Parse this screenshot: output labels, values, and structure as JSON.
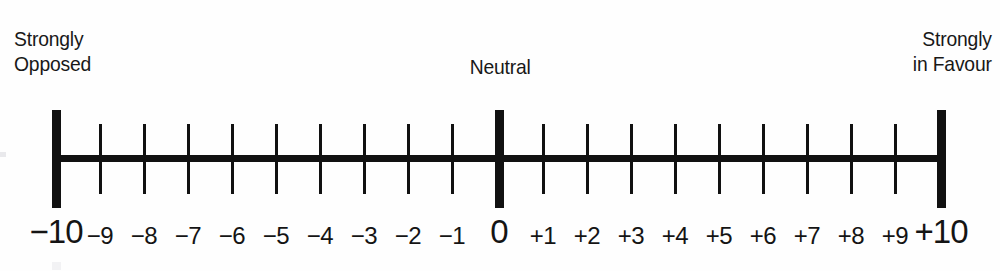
{
  "figure": {
    "name": "bipolar-opinion-rating-scale",
    "range_min": -10,
    "range_max": 10,
    "line_color": "#111111",
    "text_color": "#181818",
    "background": "#ffffff"
  },
  "anchors": {
    "left": "Strongly\nOpposed",
    "center": "Neutral",
    "right": "Strongly\nin Favour"
  },
  "scale": {
    "numbers": [
      {
        "value": -10,
        "label": "−10",
        "emphasis": "major",
        "x": 56
      },
      {
        "value": -9,
        "label": "−9",
        "emphasis": "minor",
        "x": 100
      },
      {
        "value": -8,
        "label": "−8",
        "emphasis": "minor",
        "x": 144
      },
      {
        "value": -7,
        "label": "−7",
        "emphasis": "minor",
        "x": 188
      },
      {
        "value": -6,
        "label": "−6",
        "emphasis": "minor",
        "x": 232
      },
      {
        "value": -5,
        "label": "−5",
        "emphasis": "minor",
        "x": 276
      },
      {
        "value": -4,
        "label": "−4",
        "emphasis": "minor",
        "x": 320
      },
      {
        "value": -3,
        "label": "−3",
        "emphasis": "minor",
        "x": 364
      },
      {
        "value": -2,
        "label": "−2",
        "emphasis": "minor",
        "x": 408
      },
      {
        "value": -1,
        "label": "−1",
        "emphasis": "minor",
        "x": 452
      },
      {
        "value": 0,
        "label": "0",
        "emphasis": "major",
        "x": 499
      },
      {
        "value": 1,
        "label": "+1",
        "emphasis": "minor",
        "x": 543
      },
      {
        "value": 2,
        "label": "+2",
        "emphasis": "minor",
        "x": 587
      },
      {
        "value": 3,
        "label": "+3",
        "emphasis": "minor",
        "x": 631
      },
      {
        "value": 4,
        "label": "+4",
        "emphasis": "minor",
        "x": 675
      },
      {
        "value": 5,
        "label": "+5",
        "emphasis": "minor",
        "x": 719
      },
      {
        "value": 6,
        "label": "+6",
        "emphasis": "minor",
        "x": 763
      },
      {
        "value": 7,
        "label": "+7",
        "emphasis": "minor",
        "x": 807
      },
      {
        "value": 8,
        "label": "+8",
        "emphasis": "minor",
        "x": 851
      },
      {
        "value": 9,
        "label": "+9",
        "emphasis": "minor",
        "x": 895
      },
      {
        "value": 10,
        "label": "+10",
        "emphasis": "major",
        "x": 941
      }
    ]
  },
  "chart_data": {
    "type": "table",
    "title": "",
    "xlabel": "",
    "ylabel": "",
    "categories": [
      "-10",
      "-9",
      "-8",
      "-7",
      "-6",
      "-5",
      "-4",
      "-3",
      "-2",
      "-1",
      "0",
      "+1",
      "+2",
      "+3",
      "+4",
      "+5",
      "+6",
      "+7",
      "+8",
      "+9",
      "+10"
    ],
    "values": [
      -10,
      -9,
      -8,
      -7,
      -6,
      -5,
      -4,
      -3,
      -2,
      -1,
      0,
      1,
      2,
      3,
      4,
      5,
      6,
      7,
      8,
      9,
      10
    ],
    "annotations": [
      "Strongly Opposed",
      "Neutral",
      "Strongly in Favour"
    ],
    "xlim": [
      -10,
      10
    ],
    "grid": false,
    "legend": "none"
  }
}
